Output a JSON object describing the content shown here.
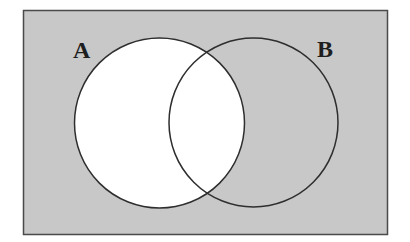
{
  "diagram": {
    "type": "venn",
    "universe": {
      "fill": "#c8c8c8",
      "stroke": "#4a4a4a"
    },
    "sets": [
      {
        "label": "A",
        "fill": "#ffffff",
        "stroke": "#2e2e2e"
      },
      {
        "label": "B",
        "fill": "none",
        "stroke": "#2e2e2e"
      }
    ],
    "shaded_region": "complement of A (everything outside A is shaded)"
  }
}
